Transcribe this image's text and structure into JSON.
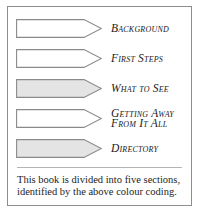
{
  "card": {
    "border_color": "#8d8d8d",
    "background": "#ffffff"
  },
  "legend": {
    "divider_color": "#b4b4b4",
    "arrow_stroke": "#8a8a8a",
    "rows": [
      {
        "label": "Background",
        "fill": "#ffffff",
        "swatch_name": "white"
      },
      {
        "label": "First Steps",
        "fill": "#ffffff",
        "swatch_name": "white"
      },
      {
        "label": "What to See",
        "fill": "#e4e4e4",
        "swatch_name": "light-grey"
      },
      {
        "label": "Getting Away\nFrom It All",
        "fill": "#ffffff",
        "swatch_name": "white"
      },
      {
        "label": "Directory",
        "fill": "#e4e4e4",
        "swatch_name": "light-grey"
      }
    ]
  },
  "caption": {
    "line1": "This book is divided into five sections,",
    "line2": "identified by the above colour coding."
  }
}
